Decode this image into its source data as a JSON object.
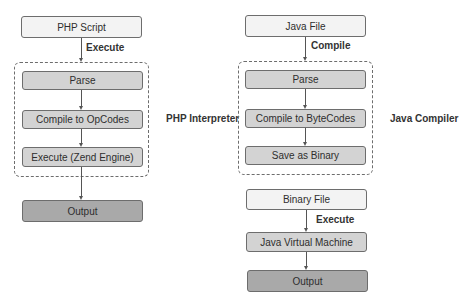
{
  "php": {
    "source": "PHP Script",
    "edge_label": "Execute",
    "group_label": "PHP Interpreter",
    "steps": [
      "Parse",
      "Compile to OpCodes",
      "Execute (Zend Engine)"
    ],
    "output": "Output"
  },
  "java": {
    "source": "Java File",
    "edge_label": "Compile",
    "group_label": "Java Compiler",
    "steps": [
      "Parse",
      "Compile to ByteCodes",
      "Save as Binary"
    ],
    "binary": "Binary File",
    "execute_label": "Execute",
    "jvm": "Java Virtual Machine",
    "output": "Output"
  },
  "colors": {
    "light_fill": "#f3f3f3",
    "step_fill": "#d3d3d3",
    "output_fill": "#a9a9a9",
    "stroke": "#6d6d6d"
  }
}
